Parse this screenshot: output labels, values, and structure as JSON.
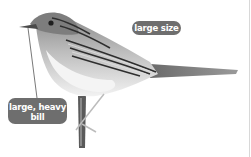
{
  "figure": {
    "annotations": [
      {
        "id": "size",
        "text": "large size"
      },
      {
        "id": "bill",
        "line1": "large, heavy",
        "line2": "bill"
      }
    ],
    "colors": {
      "label_bg": "#6e6e6e",
      "label_text": "#ffffff",
      "background": "#ffffff"
    }
  }
}
